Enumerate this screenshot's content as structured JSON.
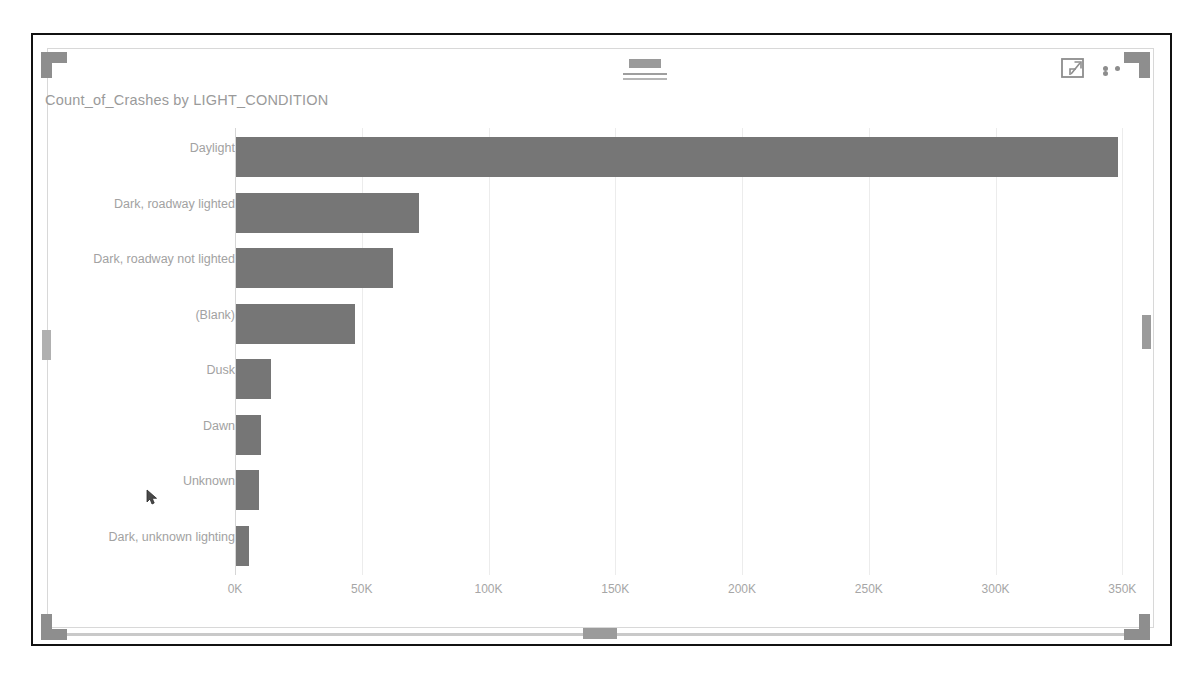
{
  "visual": {
    "title": "Count_of_Crashes by LIGHT_CONDITION",
    "drag_handle_name": "drag-handle",
    "focus_mode_label": "Focus mode",
    "more_options_label": "More options"
  },
  "colors": {
    "bar": "#767676",
    "axis_text": "#a2a2a2",
    "title_text": "#9a9a9a",
    "gridline": "#ececec",
    "handle": "#8e8e8e",
    "scrollbar": "#9b9b9b"
  },
  "scrollbars": {
    "vertical_name": "vertical-scrollbar",
    "horizontal_name": "horizontal-scrollbar"
  },
  "chart_data": {
    "type": "bar",
    "orientation": "horizontal",
    "title": "Count_of_Crashes by LIGHT_CONDITION",
    "xlabel": "",
    "ylabel": "",
    "grid": true,
    "legend": "none",
    "xlim": [
      0,
      355000
    ],
    "xticks": [
      0,
      50000,
      100000,
      150000,
      200000,
      250000,
      300000,
      350000
    ],
    "xtick_labels": [
      "0K",
      "50K",
      "100K",
      "150K",
      "200K",
      "250K",
      "300K",
      "350K"
    ],
    "categories": [
      "Daylight",
      "Dark, roadway lighted",
      "Dark, roadway not lighted",
      "(Blank)",
      "Dusk",
      "Dawn",
      "Unknown",
      "Dark, unknown lighting"
    ],
    "values": [
      348000,
      72000,
      62000,
      47000,
      14000,
      10000,
      9000,
      5000
    ],
    "series": [
      {
        "name": "Count_of_Crashes",
        "values": [
          348000,
          72000,
          62000,
          47000,
          14000,
          10000,
          9000,
          5000
        ]
      }
    ]
  }
}
